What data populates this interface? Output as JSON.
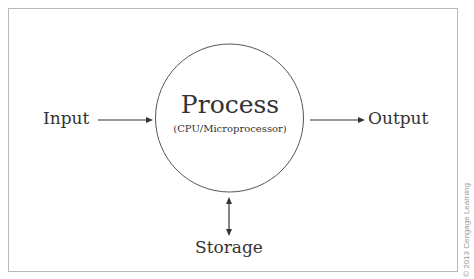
{
  "diagram": {
    "nodes": {
      "input": {
        "label": "Input"
      },
      "process": {
        "title": "Process",
        "subtitle": "(CPU/Microprocessor)"
      },
      "output": {
        "label": "Output"
      },
      "storage": {
        "label": "Storage"
      }
    },
    "edges": [
      {
        "from": "input",
        "to": "process",
        "type": "arrow"
      },
      {
        "from": "process",
        "to": "output",
        "type": "arrow"
      },
      {
        "from": "process",
        "to": "storage",
        "type": "bidirectional-arrow"
      }
    ],
    "copyright": "© 2013 Cengage Learning",
    "colors": {
      "stroke": "#333333",
      "circle_stroke": "#555555",
      "frame_border": "#b9b9b9",
      "copyright_text": "#9a9a9a"
    }
  }
}
